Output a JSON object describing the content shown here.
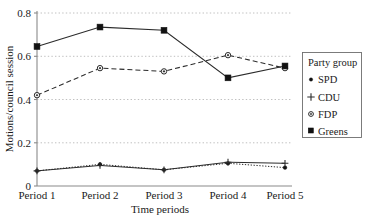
{
  "chart_data": {
    "type": "line",
    "title": "",
    "xlabel": "Time periods",
    "ylabel": "Motions/council session",
    "categories": [
      "Period 1",
      "Period 2",
      "Period 3",
      "Period 4",
      "Period 5"
    ],
    "ylim": [
      0,
      0.8
    ],
    "ytick_labels": [
      "0",
      "0.2",
      "0.4",
      "0.6",
      "0.8"
    ],
    "ytick_values": [
      0,
      0.2,
      0.4,
      0.6,
      0.8
    ],
    "grid": "horizontal-dotted",
    "legend_position": "right",
    "legend_title": "Party group",
    "series": [
      {
        "name": "SPD",
        "marker": "dot",
        "linestyle": "dotted",
        "values": [
          0.07,
          0.1,
          0.075,
          0.105,
          0.085
        ]
      },
      {
        "name": "CDU",
        "marker": "plus",
        "linestyle": "solid",
        "values": [
          0.07,
          0.095,
          0.075,
          0.11,
          0.105
        ]
      },
      {
        "name": "FDP",
        "marker": "open-circle",
        "linestyle": "dashed",
        "values": [
          0.42,
          0.545,
          0.53,
          0.605,
          0.545
        ]
      },
      {
        "name": "Greens",
        "marker": "filled-square",
        "linestyle": "solid",
        "values": [
          0.645,
          0.735,
          0.72,
          0.5,
          0.555
        ]
      }
    ]
  },
  "colors": {
    "ink": "#1a1a1a",
    "series": "#2b2b2b",
    "grid": "#b9b9b9",
    "axis": "#8a8a8a",
    "legend_border": "#6e6e6e",
    "background": "#ffffff"
  },
  "axis": {
    "y_title": "Motions/council session",
    "x_title": "Time periods"
  },
  "legend": {
    "title": "Party group",
    "items": [
      {
        "label": "SPD",
        "marker": "dot-marker"
      },
      {
        "label": "CDU",
        "marker": "plus-marker"
      },
      {
        "label": "FDP",
        "marker": "open-circle-marker"
      },
      {
        "label": "Greens",
        "marker": "filled-square-marker"
      }
    ]
  }
}
